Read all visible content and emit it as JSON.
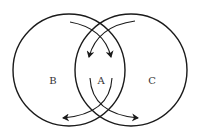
{
  "diagram": {
    "type": "venn",
    "circles": [
      {
        "name": "left",
        "cx": 69,
        "cy": 70,
        "r": 56
      },
      {
        "name": "right",
        "cx": 131,
        "cy": 70,
        "r": 56
      }
    ],
    "labels": {
      "left": "B",
      "center": "A",
      "right": "C"
    },
    "arrows": [
      {
        "from": "top-left",
        "to": "center",
        "direction": "down-right"
      },
      {
        "from": "top-right",
        "to": "center",
        "direction": "down-left"
      },
      {
        "from": "center",
        "to": "bottom-left",
        "direction": "down-left"
      },
      {
        "from": "center",
        "to": "bottom-right",
        "direction": "down-right"
      }
    ],
    "stroke_color": "#1a1a1a",
    "background": "#ffffff"
  }
}
